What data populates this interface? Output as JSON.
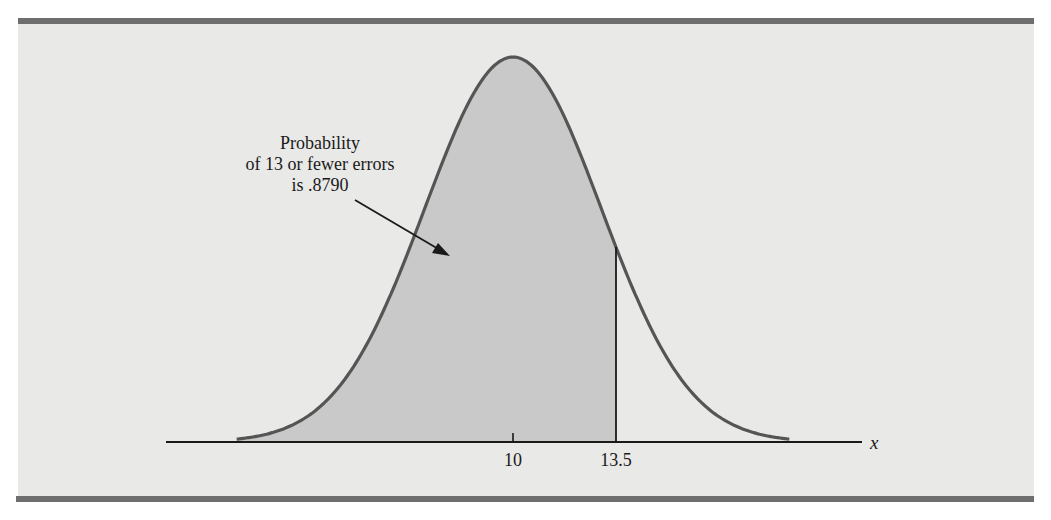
{
  "chart_data": {
    "type": "area",
    "title": "",
    "distribution": "normal",
    "mean": 10,
    "std_dev": 3,
    "shaded_region": {
      "from": "-inf",
      "to": 13.5,
      "probability": 0.879
    },
    "xlabel": "x",
    "ylabel": "",
    "x_ticks": [
      {
        "value": 10,
        "label": "10"
      },
      {
        "value": 13.5,
        "label": "13.5"
      }
    ],
    "annotation": {
      "lines": [
        "Probability",
        "of 13 or fewer errors",
        "is .8790"
      ],
      "arrow_target": "shaded-area"
    },
    "grid": false,
    "legend": null,
    "colors": {
      "background": "#e9e9e7",
      "border_bars": "#6e6e6e",
      "curve": "#555555",
      "shaded": "#c9c9c9",
      "axis": "#1a1a1a"
    }
  },
  "annotation": {
    "line1": "Probability",
    "line2": "of 13 or fewer errors",
    "line3": "is .8790"
  },
  "axis": {
    "variable": "x",
    "tick_10": "10",
    "tick_13_5": "13.5"
  }
}
